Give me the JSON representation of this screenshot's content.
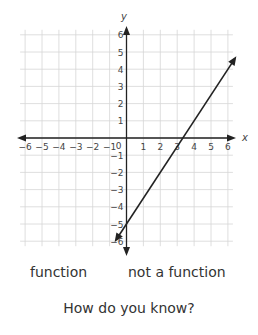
{
  "chart_data": {
    "type": "line",
    "title": "",
    "xlabel": "x",
    "ylabel": "y",
    "xlim": [
      -6,
      6
    ],
    "ylim": [
      -6,
      6
    ],
    "grid": true,
    "x_ticks": [
      "-6",
      "-5",
      "-4",
      "-3",
      "-2",
      "-1",
      "0",
      "1",
      "2",
      "3",
      "4",
      "5",
      "6"
    ],
    "y_ticks": [
      "-6",
      "-5",
      "-4",
      "-3",
      "-2",
      "-1",
      "1",
      "2",
      "3",
      "4",
      "5",
      "6"
    ],
    "series": [
      {
        "name": "line",
        "equation": "y = 1.5x - 5",
        "x": [
          -0.7,
          6.5
        ],
        "y": [
          -6.05,
          4.75
        ],
        "arrows": "both"
      }
    ],
    "annotations": []
  },
  "labels": {
    "x_axis": "x",
    "y_axis": "y",
    "origin": "0"
  },
  "choices": {
    "option_1": "function",
    "option_2": "not a function"
  },
  "question": "How do you know?"
}
